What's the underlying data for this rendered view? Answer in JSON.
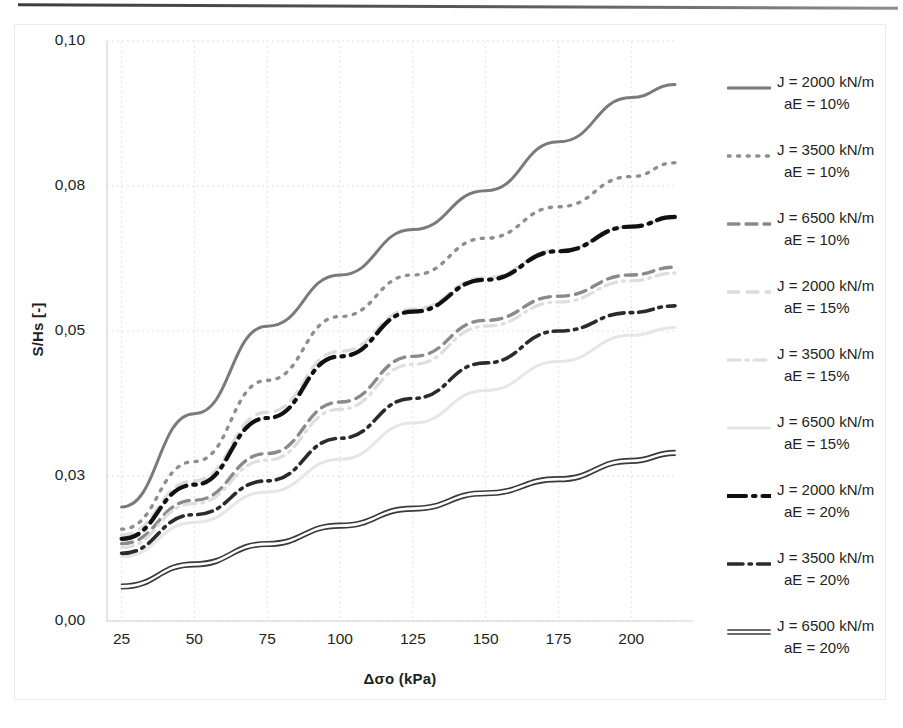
{
  "chart_data": {
    "type": "line",
    "title": "",
    "xlabel": "Δσo (kPa)",
    "ylabel": "S/Hs [-]",
    "xticks": [
      25,
      50,
      75,
      100,
      125,
      150,
      175,
      200
    ],
    "xtick_labels": [
      "25",
      "50",
      "75",
      "100",
      "125",
      "150",
      "175",
      "200"
    ],
    "yticks": [
      0.0,
      0.03,
      0.05,
      0.08,
      0.1
    ],
    "ytick_labels": [
      "0,00",
      "0,03",
      "0,05",
      "0,08",
      "0,10"
    ],
    "xlim": [
      20,
      215
    ],
    "ylim": [
      0.0,
      0.1
    ],
    "grid": true,
    "legend_position": "right",
    "x": [
      25,
      50,
      75,
      100,
      125,
      150,
      175,
      200,
      215
    ],
    "series": [
      {
        "name": "J = 2000 kN/m aE = 10%",
        "J": 2000,
        "aE": "10%",
        "style": "solid",
        "color": "#7a7a7a",
        "width": 3,
        "values": [
          0.0236,
          0.0386,
          0.051,
          0.0616,
          0.071,
          0.079,
          0.0861,
          0.0922,
          0.094
        ]
      },
      {
        "name": "J = 3500 kN/m aE = 10%",
        "J": 3500,
        "aE": "10%",
        "style": "dotted",
        "color": "#8e8e8e",
        "width": 3.4,
        "values": [
          0.019,
          0.032,
          0.0432,
          0.053,
          0.0616,
          0.0692,
          0.0757,
          0.0813,
          0.0832
        ]
      },
      {
        "name": "J = 6500 kN/m aE = 10%",
        "J": 6500,
        "aE": "10%",
        "style": "dashed",
        "color": "#8a8a8a",
        "width": 3.4,
        "values": [
          0.016,
          0.025,
          0.0331,
          0.0402,
          0.0465,
          0.0522,
          0.0572,
          0.0616,
          0.0632
        ]
      },
      {
        "name": "J = 2000 kN/m aE = 15%",
        "J": 2000,
        "aE": "15%",
        "style": "dashed-light",
        "color": "#dcdcdc",
        "width": 3.4,
        "values": [
          0.0178,
          0.029,
          0.0388,
          0.0472,
          0.0545,
          0.061,
          0.0667,
          0.0716,
          0.0734
        ]
      },
      {
        "name": "J = 3500 kN/m aE = 15%",
        "J": 3500,
        "aE": "15%",
        "style": "dashdot-light",
        "color": "#dedede",
        "width": 3.2,
        "values": [
          0.0152,
          0.0243,
          0.0322,
          0.0392,
          0.0454,
          0.051,
          0.056,
          0.0604,
          0.062
        ]
      },
      {
        "name": "J = 6500 kN/m aE = 15%",
        "J": 6500,
        "aE": "15%",
        "style": "solid-light",
        "color": "#e6e6e6",
        "width": 3,
        "values": [
          0.0133,
          0.0204,
          0.0267,
          0.0323,
          0.0373,
          0.0418,
          0.0458,
          0.0494,
          0.0507
        ]
      },
      {
        "name": "J = 2000 kN/m aE = 20%",
        "J": 2000,
        "aE": "20%",
        "style": "dashdot-bold",
        "color": "#111111",
        "width": 4.2,
        "values": [
          0.017,
          0.0282,
          0.038,
          0.0465,
          0.054,
          0.0606,
          0.0665,
          0.0716,
          0.0736
        ]
      },
      {
        "name": "J = 3500 kN/m aE = 20%",
        "J": 3500,
        "aE": "20%",
        "style": "dashdot-dark",
        "color": "#2b2b2b",
        "width": 3.6,
        "values": [
          0.014,
          0.022,
          0.029,
          0.0352,
          0.0407,
          0.0456,
          0.05,
          0.0538,
          0.0552
        ]
      },
      {
        "name": "J = 6500 kN/m aE = 20%",
        "J": 6500,
        "aE": "20%",
        "style": "double-solid",
        "color": "#3a3a3a",
        "width": 3,
        "values": [
          0.0076,
          0.0122,
          0.0164,
          0.0202,
          0.0237,
          0.0269,
          0.0298,
          0.0324,
          0.0335
        ]
      }
    ]
  },
  "axes": {
    "y_title": "S/Hs [-]",
    "x_title": "Δσo (kPa)",
    "y_labels": [
      "0,10",
      "0,08",
      "0,05",
      "0,03",
      "0,00"
    ],
    "x_labels": [
      "25",
      "50",
      "75",
      "100",
      "125",
      "150",
      "175",
      "200"
    ]
  },
  "legend": {
    "items": [
      {
        "line1": "J = 2000 kN/m",
        "line2": "aE = 10%",
        "swatch": "solid-gray-line"
      },
      {
        "line1": "J = 3500 kN/m",
        "line2": "aE = 10%",
        "swatch": "dotted-gray-line"
      },
      {
        "line1": "J = 6500 kN/m",
        "line2": "aE = 10%",
        "swatch": "dashed-gray-line"
      },
      {
        "line1": "J = 2000 kN/m",
        "line2": "aE = 15%",
        "swatch": "dashed-light-line"
      },
      {
        "line1": "J = 3500 kN/m",
        "line2": "aE = 15%",
        "swatch": "dashdot-light-line"
      },
      {
        "line1": "J = 6500 kN/m",
        "line2": "aE = 15%",
        "swatch": "solid-light-line"
      },
      {
        "line1": "J = 2000 kN/m",
        "line2": "aE = 20%",
        "swatch": "dashdot-bold-black-line"
      },
      {
        "line1": "J = 3500 kN/m",
        "line2": "aE = 20%",
        "swatch": "dashdot-dark-line"
      },
      {
        "line1": "J = 6500 kN/m",
        "line2": "aE = 20%",
        "swatch": "double-solid-dark-line"
      }
    ]
  }
}
